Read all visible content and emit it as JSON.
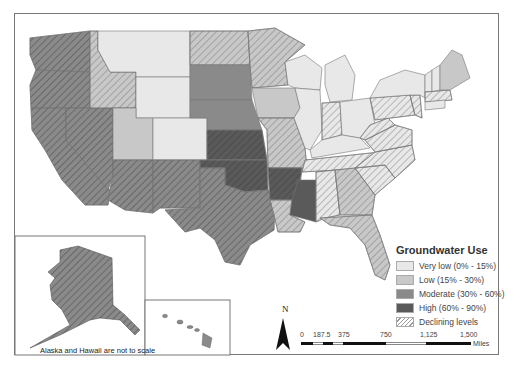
{
  "map": {
    "title": "Groundwater Use",
    "legend": {
      "title": "Groundwater Use",
      "items": [
        {
          "label": "Very low (0% - 15%)",
          "color": "#e8e8e8",
          "pattern": "none"
        },
        {
          "label": "Low (15% - 30%)",
          "color": "#c8c8c8",
          "pattern": "none"
        },
        {
          "label": "Moderate (30% - 60%)",
          "color": "#8a8a8a",
          "pattern": "none"
        },
        {
          "label": "High (60% - 90%)",
          "color": "#5a5a5a",
          "pattern": "none"
        },
        {
          "label": "Declining levels",
          "color": "#ffffff",
          "pattern": "diagonal-hatch"
        }
      ]
    },
    "north_arrow": {
      "label": "N"
    },
    "scale_bar": {
      "ticks": [
        "0",
        "187.5",
        "375",
        "750",
        "1,125",
        "1,500"
      ],
      "unit": "Miles"
    },
    "inset_note": "Alaska and Hawaii are not to scale",
    "insets": [
      "Alaska",
      "Hawaii"
    ],
    "colors": {
      "very_low": "#e8e8e8",
      "low": "#c8c8c8",
      "moderate": "#8a8a8a",
      "high": "#5a5a5a",
      "border": "#777777"
    }
  }
}
